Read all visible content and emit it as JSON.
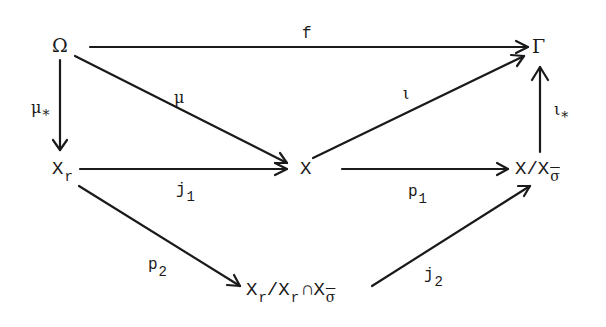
{
  "diagram": {
    "type": "commutative-diagram",
    "nodes": {
      "omega": {
        "label": "Ω"
      },
      "gamma": {
        "label": "Γ"
      },
      "xr": {
        "base": "X",
        "sub": "r"
      },
      "x": {
        "label": "X"
      },
      "quot": {
        "base": "X/X",
        "sub": "σ"
      },
      "bottom": {
        "base1": "X",
        "sub1": "r",
        "slash": "/X",
        "sub2": "r",
        "cap": "∩X",
        "sub3": "σ"
      }
    },
    "arrows": [
      {
        "from": "Ω",
        "to": "Γ",
        "label": "f"
      },
      {
        "from": "Ω",
        "to": "X",
        "label": "μ"
      },
      {
        "from": "Ω",
        "to": "X_r",
        "label": "μ",
        "label_sub": "*"
      },
      {
        "from": "X_r",
        "to": "X",
        "label": "j",
        "label_sub": "1"
      },
      {
        "from": "X",
        "to": "Γ",
        "label": "ι"
      },
      {
        "from": "X",
        "to": "X/X_σ",
        "label": "p",
        "label_sub": "1"
      },
      {
        "from": "X/X_σ",
        "to": "Γ",
        "label": "ι",
        "label_sub": "*"
      },
      {
        "from": "X_r",
        "to": "X_r/X_r∩X_σ",
        "label": "p",
        "label_sub": "2"
      },
      {
        "from": "X_r/X_r∩X_σ",
        "to": "X/X_σ",
        "label": "j",
        "label_sub": "2"
      }
    ]
  }
}
